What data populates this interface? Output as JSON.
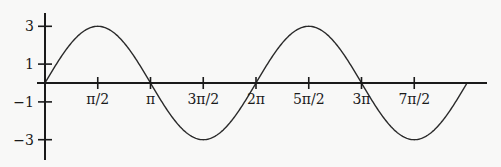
{
  "chart_data": {
    "type": "line",
    "title": "",
    "xlabel": "",
    "ylabel": "",
    "function": "y = 3 sin(x)",
    "xlim": [
      0,
      12.566
    ],
    "ylim": [
      -3,
      3
    ],
    "grid": false,
    "legend": null,
    "x_ticks": [
      {
        "value": 1.5708,
        "label": "π/2"
      },
      {
        "value": 3.1416,
        "label": "π"
      },
      {
        "value": 4.7124,
        "label": "3π/2"
      },
      {
        "value": 6.2832,
        "label": "2π"
      },
      {
        "value": 7.854,
        "label": "5π/2"
      },
      {
        "value": 9.4248,
        "label": "3π"
      },
      {
        "value": 10.9956,
        "label": "7π/2"
      }
    ],
    "y_ticks": [
      {
        "value": 3,
        "label": "3"
      },
      {
        "value": 1,
        "label": "1"
      },
      {
        "value": -1,
        "label": "−1"
      },
      {
        "value": -3,
        "label": "−3"
      }
    ],
    "series": [
      {
        "name": "3 sin x",
        "x": [
          0,
          1.5708,
          3.1416,
          4.7124,
          6.2832,
          7.854,
          9.4248,
          10.9956,
          12.5664
        ],
        "values": [
          0,
          3,
          0,
          -3,
          0,
          3,
          0,
          -3,
          0
        ]
      }
    ]
  },
  "layout": {
    "origin_px": [
      45,
      83
    ],
    "px_per_half_pi": 52.75,
    "px_per_unit_y": 18.9,
    "x_axis_end_px": 487,
    "y_axis_top_px": 13,
    "y_axis_bottom_px": 160,
    "curve_color": "#2a2a2a",
    "axis_color": "#1a1a1a"
  }
}
